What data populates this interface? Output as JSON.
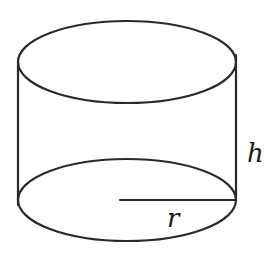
{
  "diagram": {
    "type": "cylinder",
    "stroke_color": "#2a2a2a",
    "background": "#ffffff",
    "top_ellipse": {
      "cx": 127,
      "cy": 62,
      "rx": 109,
      "ry": 41
    },
    "bottom_ellipse": {
      "cx": 127,
      "cy": 200,
      "rx": 109,
      "ry": 41
    },
    "labels": {
      "height": "h",
      "radius": "r"
    }
  }
}
